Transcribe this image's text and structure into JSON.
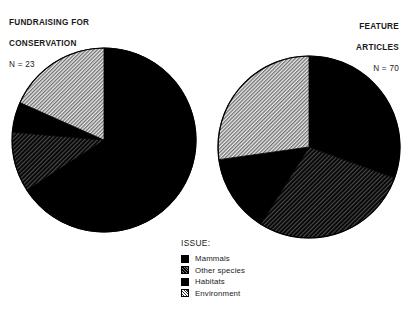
{
  "charts": [
    {
      "id": "fundraising-for-conservation",
      "title_line1": "FUNDRAISING FOR",
      "title_line2": "CONSERVATION",
      "n_label": "N = 23"
    },
    {
      "id": "feature-articles",
      "title_line1": "FEATURE",
      "title_line2": "ARTICLES",
      "n_label": "N = 70"
    }
  ],
  "legend": {
    "title": "ISSUE:",
    "items": [
      {
        "label": "Mammals",
        "pattern": "solid-black",
        "color": "#000000"
      },
      {
        "label": "Other species",
        "pattern": "dark-hatch",
        "color": "#2b2b2b"
      },
      {
        "label": "Habitats",
        "pattern": "solid-black",
        "color": "#000000"
      },
      {
        "label": "Environment",
        "pattern": "light-hatch",
        "color": "#c8c8c8"
      }
    ]
  },
  "chart_data": [
    {
      "type": "pie",
      "title": "FUNDRAISING FOR CONSERVATION",
      "n": 23,
      "n_label": "N = 23",
      "xlabel": "",
      "ylabel": "",
      "legend_position": "bottom-center",
      "grid": false,
      "categories": [
        "Mammals",
        "Other species",
        "Habitats",
        "Environment"
      ],
      "values": [
        65.8,
        10.6,
        5.3,
        18.3
      ],
      "unit": "percent",
      "slices": [
        {
          "label": "Mammals",
          "percent": 65.8,
          "start_deg": 0,
          "end_deg": 237,
          "pattern": "solid-black"
        },
        {
          "label": "Other species",
          "percent": 10.6,
          "start_deg": 237,
          "end_deg": 275,
          "pattern": "dark-hatch"
        },
        {
          "label": "Habitats",
          "percent": 5.3,
          "start_deg": 275,
          "end_deg": 294,
          "pattern": "solid-black"
        },
        {
          "label": "Environment",
          "percent": 18.3,
          "start_deg": 294,
          "end_deg": 360,
          "pattern": "light-hatch"
        }
      ]
    },
    {
      "type": "pie",
      "title": "FEATURE ARTICLES",
      "n": 70,
      "n_label": "N = 70",
      "xlabel": "",
      "ylabel": "",
      "legend_position": "bottom-center",
      "grid": false,
      "categories": [
        "Mammals",
        "Other species",
        "Habitats",
        "Environment"
      ],
      "values": [
        30.5,
        28.3,
        13.9,
        27.3
      ],
      "unit": "percent",
      "slices": [
        {
          "label": "Mammals",
          "percent": 30.5,
          "start_deg": 0,
          "end_deg": 110,
          "pattern": "solid-black"
        },
        {
          "label": "Other species",
          "percent": 28.3,
          "start_deg": 110,
          "end_deg": 212,
          "pattern": "dark-hatch"
        },
        {
          "label": "Habitats",
          "percent": 13.9,
          "start_deg": 212,
          "end_deg": 262,
          "pattern": "solid-black"
        },
        {
          "label": "Environment",
          "percent": 27.3,
          "start_deg": 262,
          "end_deg": 360,
          "pattern": "light-hatch"
        }
      ]
    }
  ]
}
